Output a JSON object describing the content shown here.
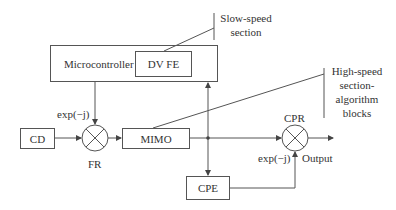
{
  "blocks": {
    "microcontroller": "Microcontroller",
    "dvfe": "DV FE",
    "cd": "CD",
    "mimo": "MIMO",
    "cpe": "CPE"
  },
  "mixers": {
    "fr": {
      "label": "FR",
      "input_label": "exp(−j)"
    },
    "cpr": {
      "label": "CPR",
      "input_label": "exp(−j)"
    }
  },
  "annotations": {
    "slow_line1": "Slow-speed",
    "slow_line2": "section",
    "high_line1": "High-speed",
    "high_line2": "section-",
    "high_line3": "algorithm",
    "high_line4": "blocks"
  },
  "output_label": "Output",
  "colors": {
    "line": "#555555",
    "text": "#333333",
    "background": "#ffffff"
  }
}
